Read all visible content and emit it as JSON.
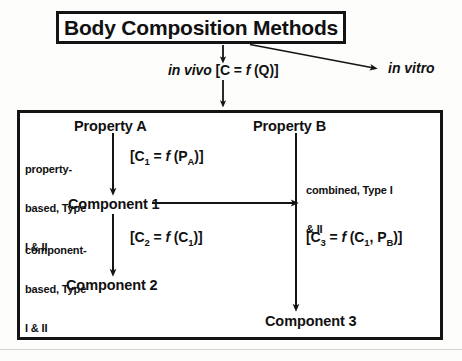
{
  "diagram": {
    "title": "Body Composition Methods",
    "title_box": {
      "border_color": "#141414"
    },
    "branches": {
      "in_vivo": {
        "label_italic": "in vivo",
        "formula": "[C = f (Q)]",
        "formula_plain": "[C = f (Q)]"
      },
      "in_vitro": {
        "label_italic": "in vitro"
      }
    },
    "nodes": {
      "property_a": "Property A",
      "property_b": "Property B",
      "component_1": "Component 1",
      "component_2": "Component 2",
      "component_3": "Component 3"
    },
    "edge_labels": {
      "property_based": {
        "line1": "property-",
        "line2": "based, Type",
        "line3": "I & II",
        "full": "property-based, Type I & II"
      },
      "component_based": {
        "line1": "component-",
        "line2": "based, Type",
        "line3": "I & II",
        "full": "component-based, Type I & II"
      },
      "combined": {
        "line1": "combined, Type I",
        "line2": "& II",
        "full": "combined, Type I & II"
      }
    },
    "formulas": {
      "c1": {
        "lhs": "[C",
        "lhs_sub": "1",
        "eq": " = ",
        "fn": "f",
        "arg_open": " (P",
        "arg_sub": "A",
        "arg_close": ")]",
        "full": "[C1 = f (PA)]"
      },
      "c2": {
        "lhs": "[C",
        "lhs_sub": "2",
        "eq": " = ",
        "fn": "f",
        "arg_open": " (C",
        "arg_sub": "1",
        "arg_close": ")]",
        "full": "[C2 = f (C1)]"
      },
      "c3": {
        "lhs": "[C",
        "lhs_sub": "3",
        "eq": " = ",
        "fn": "f",
        "arg_open": " (C",
        "arg_sub1": "1",
        "arg_mid": ", P",
        "arg_sub2": "B",
        "arg_close": ")]",
        "full": "[C3 = f (C1, PB)]"
      }
    },
    "colors": {
      "ink": "#141414",
      "page": "#fdfdfc"
    }
  }
}
